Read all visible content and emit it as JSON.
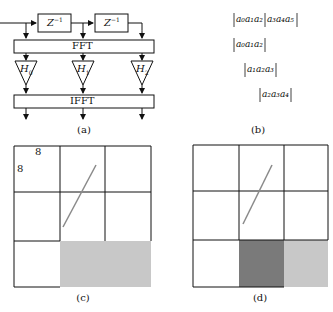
{
  "panel_a": {
    "caption": "(a)",
    "delays": [
      {
        "label": "Z",
        "exp": "−1"
      },
      {
        "label": "Z",
        "exp": "−1"
      }
    ],
    "fft_label": "FFT",
    "ifft_label": "IFFT",
    "filters": [
      {
        "label": "H",
        "sub": "0"
      },
      {
        "label": "H",
        "sub": "1"
      },
      {
        "label": "H",
        "sub": "2"
      }
    ]
  },
  "panel_b": {
    "caption": "(b)",
    "rows": [
      {
        "text": "a₀a₁a₂",
        "text2": "a₃a₄a₅"
      },
      {
        "text": "a₀a₁a₂"
      },
      {
        "text": "a₁a₂a₃"
      },
      {
        "text": "a₂a₃a₄"
      }
    ]
  },
  "panel_c": {
    "caption": "(c)",
    "dim_top": "8",
    "dim_left": "8",
    "shade_color": "#c8c8c8"
  },
  "panel_d": {
    "caption": "(d)",
    "dark_shade_color": "#7a7a7a",
    "light_shade_color": "#c8c8c8"
  }
}
